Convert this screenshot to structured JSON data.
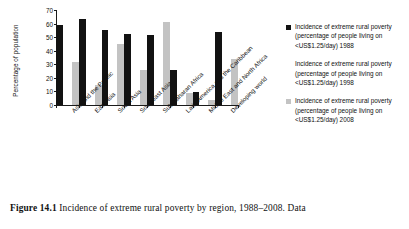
{
  "chart_data": {
    "type": "bar",
    "title": "",
    "xlabel": "",
    "ylabel": "Percentage of population",
    "ylim": [
      0,
      70
    ],
    "yticks": [
      "0",
      "10",
      "20",
      "30",
      "40",
      "50",
      "60",
      "70"
    ],
    "grid": false,
    "legend_position": "right",
    "categories": [
      "Asia and the Pacific",
      "East Asia",
      "South Asia",
      "Southeast Asia",
      "Sub-Saharan Africa",
      "Latin America and the Caribbean",
      "Middle East and North Africa",
      "Developing world"
    ],
    "series": [
      {
        "name": "Incidence of extreme rural poverty (percentage of people living on <US$1.25/day) 1988",
        "year": "1988",
        "color": "#121212",
        "values": [
          59.0,
          63.5,
          55.5,
          52.0,
          51.5,
          26.0,
          9.7,
          53.5
        ]
      },
      {
        "name": "Incidence of extreme rural poverty (percentage of people living on <US$1.25/day) 1998",
        "year": "1998",
        "color": "#ffffff",
        "values": [
          0,
          0,
          0,
          0,
          0,
          0,
          0,
          0
        ]
      },
      {
        "name": "Incidence of extreme rural poverty (percentage of people living on <US$1.25/day) 2008",
        "year": "2008",
        "color": "#c3c3c3",
        "values": [
          31.5,
          15.0,
          45.0,
          25.5,
          61.0,
          8.7,
          3.5,
          34.0
        ]
      }
    ]
  },
  "legend": {
    "items": [
      {
        "label": "Incidence of extreme rural poverty (percentage of people living on <US$1.25/day) 1988",
        "swatch": "black-square-icon"
      },
      {
        "label": "Incidence of extreme rural poverty (percentage of people living on <US$1.25/day) 1998",
        "swatch": "white-square-icon"
      },
      {
        "label": "Incidence of extreme rural poverty (percentage of people living on <US$1.25/day) 2008",
        "swatch": "gray-square-icon"
      }
    ]
  },
  "caption": {
    "figure_number": "Figure 14.1",
    "text": "Incidence of extreme rural poverty by region, 1988–2008. Data"
  }
}
